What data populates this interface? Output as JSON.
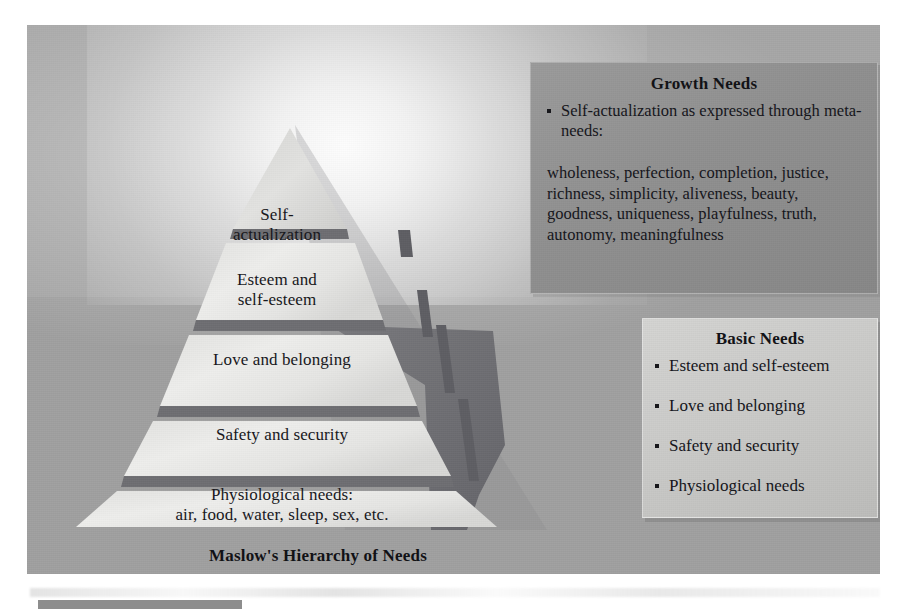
{
  "figure": {
    "title": "Maslow's Hierarchy of Needs",
    "pyramid": {
      "levels": [
        {
          "id": "self-actualization",
          "label": "Self-\nactualization"
        },
        {
          "id": "esteem",
          "label": "Esteem and\nself-esteem"
        },
        {
          "id": "love-belonging",
          "label": "Love and belonging"
        },
        {
          "id": "safety-security",
          "label": "Safety and security"
        },
        {
          "id": "physiological",
          "label": "Physiological needs:\nair, food, water, sleep, sex, etc."
        }
      ]
    },
    "growth_box": {
      "title": "Growth Needs",
      "bullets": [
        "Self-actualization as expressed through meta-needs:"
      ],
      "meta_needs": "wholeness, perfection, completion, justice, richness, simplicity, aliveness, beauty, goodness, uniqueness, playfulness, truth, autonomy, meaningfulness"
    },
    "basic_box": {
      "title": "Basic Needs",
      "bullets": [
        "Esteem and self-esteem",
        "Love and belonging",
        "Safety and security",
        "Physiological needs"
      ]
    },
    "colors": {
      "background_upper": "#a6a6a6",
      "background_lower": "#a0a0a0",
      "pyramid_face": "#e8e8e6",
      "pyramid_divider": "#6e6e72",
      "shadow_wedge": "#6f6f73",
      "growth_box_bg": "#909090",
      "basic_box_bg": "#cbcbc9",
      "text": "#16161a"
    }
  }
}
